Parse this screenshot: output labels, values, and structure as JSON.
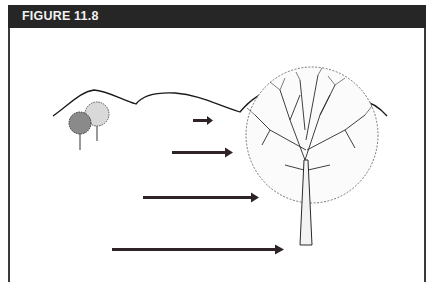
{
  "figure": {
    "label": "FIGURE 11.8",
    "header_color": "#262626",
    "arrow_color": "#2e2327",
    "ink_color": "#1a1a1a"
  },
  "scene": {
    "elements": [
      "hills",
      "distant-trees",
      "large-tree",
      "arrows"
    ],
    "arrows": [
      {
        "name": "arrow-1",
        "relative_length": 0.08
      },
      {
        "name": "arrow-2",
        "relative_length": 0.22
      },
      {
        "name": "arrow-3",
        "relative_length": 0.42
      },
      {
        "name": "arrow-4",
        "relative_length": 0.62
      }
    ]
  }
}
